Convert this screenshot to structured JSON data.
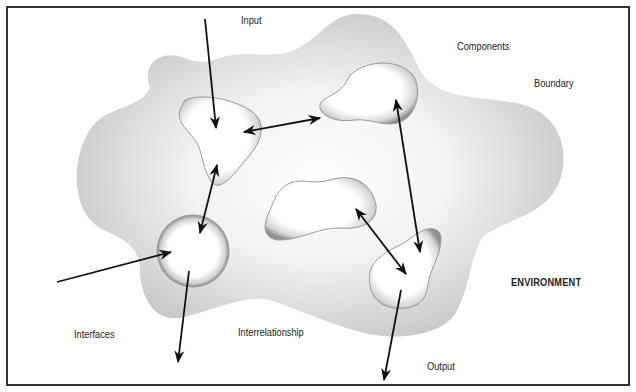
{
  "diagram": {
    "type": "systems-model",
    "labels": {
      "input": "Input",
      "components": "Components",
      "boundary": "Boundary",
      "environment": "ENVIRONMENT",
      "interfaces": "Interfaces",
      "interrelationship": "Interrelationship",
      "output": "Output"
    },
    "colors": {
      "boundary_fill": "#c8c8c8",
      "component_fill": "#ffffff",
      "arrow": "#111111",
      "frame": "#333333"
    },
    "components": [
      {
        "name": "component-top-left",
        "shape": "triangle-blob"
      },
      {
        "name": "component-top-right",
        "shape": "peanut-blob"
      },
      {
        "name": "component-center",
        "shape": "kidney-blob"
      },
      {
        "name": "component-circle",
        "shape": "circle"
      },
      {
        "name": "component-bottom-right",
        "shape": "irregular-blob"
      }
    ],
    "connections": [
      {
        "from": "external-input",
        "to": "component-top-left"
      },
      {
        "from": "component-top-left",
        "to": "component-top-right",
        "bidirectional": true
      },
      {
        "from": "component-top-left",
        "to": "component-circle",
        "bidirectional": true
      },
      {
        "from": "component-top-right",
        "to": "component-bottom-right",
        "bidirectional": true
      },
      {
        "from": "component-center",
        "to": "component-bottom-right",
        "bidirectional": true
      },
      {
        "from": "external-left",
        "to": "component-circle"
      },
      {
        "from": "component-circle",
        "to": "external-output-left"
      },
      {
        "from": "component-bottom-right",
        "to": "external-output"
      }
    ]
  }
}
